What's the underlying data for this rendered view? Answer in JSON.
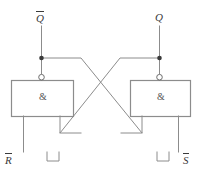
{
  "diagram": {
    "type": "logic-circuit-schematic",
    "stroke_color": "#8c8c8c",
    "text_color": "#3a3a3a",
    "background_color": "#ffffff"
  },
  "labels": {
    "output_qbar": "Q",
    "output_qbar_overbar": true,
    "output_q": "Q",
    "output_q_overbar": false,
    "input_rbar": "R",
    "input_rbar_overbar": true,
    "input_sbar": "S",
    "input_sbar_overbar": true
  },
  "gates": {
    "left": {
      "symbol": "&",
      "name": "NAND gate left",
      "has_inversion_bubble": true
    },
    "right": {
      "symbol": "&",
      "name": "NAND gate right",
      "has_inversion_bubble": true
    }
  },
  "markers": {
    "junction_dot_left": "filled-junction",
    "junction_dot_right": "filled-junction",
    "pulse_left": "negative-going-pulse",
    "pulse_right": "negative-going-pulse"
  }
}
